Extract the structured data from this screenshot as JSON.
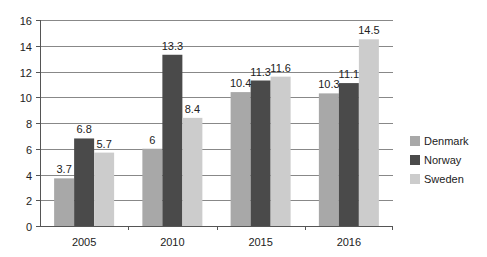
{
  "chart_data": {
    "type": "bar",
    "title": "",
    "xlabel": "",
    "ylabel": "",
    "categories": [
      "2005",
      "2010",
      "2015",
      "2016"
    ],
    "series": [
      {
        "name": "Denmark",
        "color": "#a8a8a8",
        "values": [
          3.7,
          6,
          10.4,
          10.3
        ]
      },
      {
        "name": "Norway",
        "color": "#4a4a4a",
        "values": [
          6.8,
          13.3,
          11.3,
          11.1
        ]
      },
      {
        "name": "Sweden",
        "color": "#cccccc",
        "values": [
          5.7,
          8.4,
          11.6,
          14.5
        ]
      }
    ],
    "ylim": [
      0,
      16
    ],
    "yticks": [
      0,
      2,
      4,
      6,
      8,
      10,
      12,
      14,
      16
    ],
    "grid": true,
    "legend_position": "right",
    "data_labels": true
  },
  "legend": {
    "items": [
      {
        "label": "Denmark",
        "color": "#a8a8a8"
      },
      {
        "label": "Norway",
        "color": "#4a4a4a"
      },
      {
        "label": "Sweden",
        "color": "#cccccc"
      }
    ]
  }
}
